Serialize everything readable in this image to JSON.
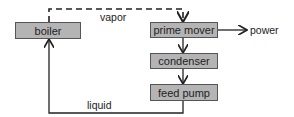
{
  "diagram": {
    "nodes": [
      {
        "id": "boiler",
        "label": "boiler"
      },
      {
        "id": "prime_mover",
        "label": "prime mover"
      },
      {
        "id": "condenser",
        "label": "condenser"
      },
      {
        "id": "feed_pump",
        "label": "feed pump"
      }
    ],
    "edges": [
      {
        "from": "boiler",
        "to": "prime_mover",
        "label": "vapor",
        "style": "dashed"
      },
      {
        "from": "prime_mover",
        "to": "power",
        "label": "power"
      },
      {
        "from": "prime_mover",
        "to": "condenser",
        "label": ""
      },
      {
        "from": "condenser",
        "to": "feed_pump",
        "label": ""
      },
      {
        "from": "feed_pump",
        "to": "boiler",
        "label": "liquid"
      }
    ],
    "labels": {
      "vapor": "vapor",
      "power": "power",
      "liquid": "liquid"
    }
  }
}
